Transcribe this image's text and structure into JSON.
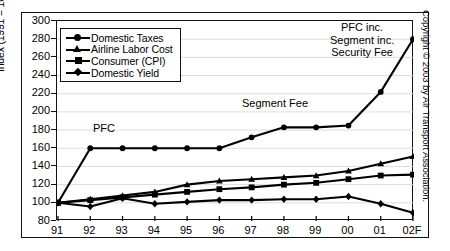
{
  "chart_data": {
    "type": "line",
    "title": "",
    "xlabel": "",
    "ylabel": "Index (1991 = 100)",
    "categories": [
      "91",
      "92",
      "93",
      "94",
      "95",
      "96",
      "97",
      "98",
      "99",
      "00",
      "01",
      "02F"
    ],
    "ylim": [
      80,
      300
    ],
    "ytick_step": 20,
    "yticks": [
      80,
      100,
      120,
      140,
      160,
      180,
      200,
      220,
      240,
      260,
      280,
      300
    ],
    "grid": true,
    "legend_position": "top-left",
    "series": [
      {
        "name": "Domestic Taxes",
        "marker": "circle",
        "values": [
          100,
          160,
          160,
          160,
          160,
          160,
          172,
          183,
          183,
          185,
          222,
          280
        ]
      },
      {
        "name": "Airline Labor Cost",
        "marker": "triangle",
        "values": [
          100,
          104,
          108,
          112,
          120,
          124,
          126,
          128,
          130,
          135,
          143,
          151
        ]
      },
      {
        "name": "Consumer (CPI)",
        "marker": "square",
        "values": [
          100,
          103,
          106,
          109,
          112,
          115,
          117,
          120,
          122,
          126,
          130,
          131
        ]
      },
      {
        "name": "Domestic Yield",
        "marker": "diamond",
        "values": [
          100,
          96,
          105,
          99,
          101,
          103,
          103,
          104,
          104,
          107,
          99,
          89
        ]
      }
    ],
    "annotations": [
      {
        "text": "PFC",
        "x": "92",
        "y": 172
      },
      {
        "text": "Segment Fee",
        "x": "98",
        "y": 192
      },
      {
        "text": "PFC inc.\nSegment inc.\nSecurity Fee",
        "x": "01",
        "y": 290
      }
    ]
  },
  "labels": {
    "y_axis_title": "Index (1991 = 100)",
    "yticks": [
      "300",
      "280",
      "260",
      "240",
      "220",
      "200",
      "180",
      "160",
      "140",
      "120",
      "100",
      "80"
    ],
    "xticks": [
      "91",
      "92",
      "93",
      "94",
      "95",
      "96",
      "97",
      "98",
      "99",
      "00",
      "01",
      "02F"
    ]
  },
  "legend": {
    "items": [
      {
        "label": "Domestic Taxes",
        "marker": "circle-marker"
      },
      {
        "label": "Airline Labor Cost",
        "marker": "triangle-marker"
      },
      {
        "label": "Consumer (CPI)",
        "marker": "square-marker"
      },
      {
        "label": "Domestic Yield",
        "marker": "diamond-marker"
      }
    ]
  },
  "annotations": {
    "pfc": "PFC",
    "segment_fee": "Segment Fee",
    "pfc_inc_line1": "PFC inc.",
    "pfc_inc_line2": "Segment inc.",
    "pfc_inc_line3": "Security Fee"
  },
  "copyright": "Copyright © 2003 by Air Transport Association.",
  "colors": {
    "ink": "#000000",
    "grid": "#d8d8d8",
    "frame": "#111111"
  }
}
